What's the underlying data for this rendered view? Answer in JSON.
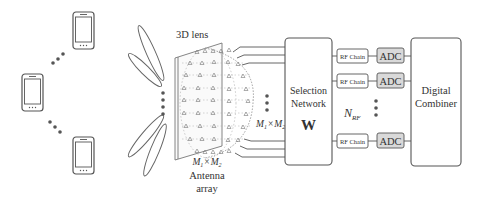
{
  "diagram": {
    "users": {
      "count_visible": 3,
      "icon": "smartphone-icon"
    },
    "lens": {
      "label": "3D lens"
    },
    "antenna_array": {
      "dims_main": "M",
      "sub1": "1",
      "times": "×",
      "sub2": "2",
      "label_line1": "Antenna",
      "label_line2": "array"
    },
    "feed_lines": {
      "dims_main": "M",
      "sub1": "1",
      "times": "×",
      "sub2": "2"
    },
    "selection_network": {
      "line1": "Selection",
      "line2": "Network",
      "matrix": "W"
    },
    "rf_chains": [
      {
        "label": "RF Chain",
        "adc": "ADC"
      },
      {
        "label": "RF Chain",
        "adc": "ADC"
      },
      {
        "label": "RF Chain",
        "adc": "ADC"
      }
    ],
    "nrf": {
      "main": "N",
      "sub": "RF"
    },
    "digital_combiner": {
      "line1": "Digital",
      "line2": "Combiner"
    },
    "colors": {
      "stroke": "#555555",
      "adc_fill": "#d9d9d9",
      "dots": "#555555"
    }
  }
}
